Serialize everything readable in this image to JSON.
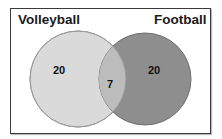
{
  "diagram": {
    "type": "venn",
    "sets": [
      {
        "name": "Volleyball",
        "only_count": "20",
        "fill": "#d9d9d9"
      },
      {
        "name": "Football",
        "only_count": "20",
        "fill": "#8f8f8f"
      }
    ],
    "intersection_count": "7",
    "intersection_fill": "#bdbdbd",
    "stroke": "#8a8a8a"
  }
}
